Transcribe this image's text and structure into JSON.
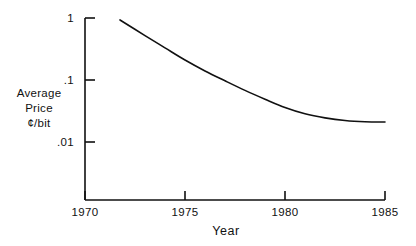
{
  "chart_data": {
    "type": "line",
    "title": "",
    "xlabel": "Year",
    "ylabel": "Average Price ¢/bit",
    "ylabel_lines": [
      "Average",
      "Price",
      "¢/bit"
    ],
    "yscale": "log",
    "xscale": "linear",
    "xlim": [
      1970,
      1985
    ],
    "ylim": [
      0.0025,
      1.0
    ],
    "grid": false,
    "legend": null,
    "xticks": [
      1970,
      1975,
      1980,
      1985
    ],
    "xtick_labels": [
      "1970",
      "1975",
      "1980",
      "1985"
    ],
    "yticks": [
      1,
      0.1,
      0.01
    ],
    "ytick_labels": [
      "1",
      ".1",
      ".01"
    ],
    "series": [
      {
        "name": "Average Price per bit",
        "x": [
          1971.75,
          1973,
          1974,
          1975,
          1976,
          1977,
          1978,
          1979,
          1980,
          1981,
          1982,
          1983,
          1984,
          1985
        ],
        "values": [
          0.93,
          0.52,
          0.33,
          0.21,
          0.14,
          0.097,
          0.068,
          0.049,
          0.036,
          0.0285,
          0.0245,
          0.0222,
          0.0212,
          0.021
        ],
        "color": "#111111",
        "linewidth": 1.6,
        "marker": "none"
      }
    ],
    "annotations": []
  },
  "axes": {
    "y_axis_name": "price-axis",
    "x_axis_name": "year-axis",
    "spines": [
      "left",
      "bottom"
    ]
  }
}
